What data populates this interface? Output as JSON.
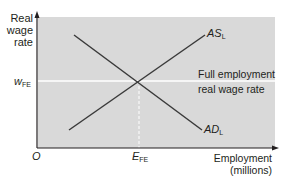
{
  "diagram": {
    "type": "labour-market-equilibrium",
    "y_axis_label_lines": [
      "Real",
      "wage",
      "rate"
    ],
    "x_axis_label_lines": [
      "Employment",
      "(millions)"
    ],
    "origin_label": "O",
    "wage_label": {
      "main": "w",
      "sub": "FE"
    },
    "employment_label": {
      "main": "E",
      "sub": "FE"
    },
    "supply_curve": {
      "main": "AS",
      "sub": "L"
    },
    "demand_curve": {
      "main": "AD",
      "sub": "L"
    },
    "annotation_lines": [
      "Full employment",
      "real wage rate"
    ],
    "colors": {
      "plot_background": "#d9d9d9",
      "curve": "#3a3a3a",
      "axis": "#231f20",
      "guide_line": "#ffffff"
    }
  }
}
